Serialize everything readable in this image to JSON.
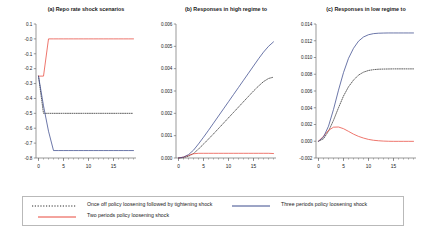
{
  "figure": {
    "panels": [
      {
        "id": "a",
        "title": "(a) Repo rate shock scenarios",
        "ylim": [
          -0.8,
          0.1
        ],
        "yticks": [
          "0.1",
          "-0.0",
          "-0.1",
          "-0.2",
          "-0.3",
          "-0.4",
          "-0.5",
          "-0.6",
          "-0.7",
          "-0.8"
        ],
        "ytickvals": [
          0.1,
          0.0,
          -0.1,
          -0.2,
          -0.3,
          -0.4,
          -0.5,
          -0.6,
          -0.7,
          -0.8
        ],
        "xlim": [
          -0.5,
          19.5
        ],
        "xticks": [
          "0",
          "5",
          "10",
          "15"
        ],
        "xtickvals": [
          0,
          5,
          10,
          15
        ]
      },
      {
        "id": "b",
        "title": "(b) Responses in high regime to",
        "ylim": [
          0.0,
          0.006
        ],
        "yticks": [
          "0.000",
          "0.001",
          "0.002",
          "0.003",
          "0.004",
          "0.005",
          "0.006"
        ],
        "ytickvals": [
          0.0,
          0.001,
          0.002,
          0.003,
          0.004,
          0.005,
          0.006
        ],
        "xlim": [
          -0.5,
          19.5
        ],
        "xticks": [
          "0",
          "5",
          "10",
          "15"
        ],
        "xtickvals": [
          0,
          5,
          10,
          15
        ]
      },
      {
        "id": "c",
        "title": "(c) Responses in low regime to",
        "ylim": [
          -0.002,
          0.014
        ],
        "yticks": [
          "-0.002",
          "0.000",
          "0.002",
          "0.004",
          "0.006",
          "0.008",
          "0.010",
          "0.012",
          "0.014"
        ],
        "ytickvals": [
          -0.002,
          0.0,
          0.002,
          0.004,
          0.006,
          0.008,
          0.01,
          0.012,
          0.014
        ],
        "xlim": [
          -0.5,
          19.5
        ],
        "xticks": [
          "0",
          "5",
          "10",
          "15"
        ],
        "xtickvals": [
          0,
          5,
          10,
          15
        ]
      }
    ],
    "legend": {
      "items": [
        {
          "label": "Once off policy loosening followed by tightening shock",
          "color": "#2a2a2a",
          "style": "dotted"
        },
        {
          "label": "Three periods policy loosening shock",
          "color": "#3b4a8c",
          "style": "solid"
        },
        {
          "label": "Two periods policy loosening shock",
          "color": "#e8483c",
          "style": "solid"
        }
      ]
    },
    "colors": {
      "once_off": "#2a2a2a",
      "three_periods": "#3b4a8c",
      "two_periods": "#e8483c",
      "axis": "#6e6e6e",
      "text": "#1a1a1a",
      "legend_border": "#b9b9b9"
    }
  },
  "chart_data": [
    {
      "type": "line",
      "panel": "a",
      "title": "(a) Repo rate shock scenarios",
      "xlabel": "",
      "ylabel": "",
      "xlim": [
        -0.5,
        19.5
      ],
      "ylim": [
        -0.8,
        0.1
      ],
      "grid": false,
      "legend_position": "bottom-shared",
      "x": [
        0,
        1,
        2,
        3,
        4,
        5,
        6,
        7,
        8,
        9,
        10,
        11,
        12,
        13,
        14,
        15,
        16,
        17,
        18,
        19
      ],
      "series": [
        {
          "name": "Once off policy loosening followed by tightening shock",
          "values": [
            -0.25,
            -0.5,
            -0.5,
            -0.5,
            -0.5,
            -0.5,
            -0.5,
            -0.5,
            -0.5,
            -0.5,
            -0.5,
            -0.5,
            -0.5,
            -0.5,
            -0.5,
            -0.5,
            -0.5,
            -0.5,
            -0.5,
            -0.5
          ],
          "color": "#2a2a2a",
          "style": "dotted"
        },
        {
          "name": "Two periods policy loosening shock",
          "values": [
            -0.25,
            -0.25,
            0.0,
            0.0,
            0.0,
            0.0,
            0.0,
            0.0,
            0.0,
            0.0,
            0.0,
            0.0,
            0.0,
            0.0,
            0.0,
            0.0,
            0.0,
            0.0,
            0.0,
            0.0
          ],
          "color": "#e8483c",
          "style": "solid"
        },
        {
          "name": "Three periods policy loosening shock",
          "values": [
            -0.25,
            -0.45,
            -0.62,
            -0.75,
            -0.75,
            -0.75,
            -0.75,
            -0.75,
            -0.75,
            -0.75,
            -0.75,
            -0.75,
            -0.75,
            -0.75,
            -0.75,
            -0.75,
            -0.75,
            -0.75,
            -0.75,
            -0.75
          ],
          "color": "#3b4a8c",
          "style": "solid"
        }
      ]
    },
    {
      "type": "line",
      "panel": "b",
      "title": "(b) Responses in high regime to",
      "xlabel": "",
      "ylabel": "",
      "xlim": [
        -0.5,
        19.5
      ],
      "ylim": [
        0.0,
        0.006
      ],
      "grid": false,
      "legend_position": "bottom-shared",
      "x": [
        0,
        1,
        2,
        3,
        4,
        5,
        6,
        7,
        8,
        9,
        10,
        11,
        12,
        13,
        14,
        15,
        16,
        17,
        18,
        19
      ],
      "series": [
        {
          "name": "Once off policy loosening followed by tightening shock",
          "values": [
            0.0,
            2e-05,
            8e-05,
            0.0002,
            0.0004,
            0.00062,
            0.00085,
            0.00108,
            0.00132,
            0.00156,
            0.0018,
            0.00204,
            0.00228,
            0.00252,
            0.00276,
            0.003,
            0.00322,
            0.00342,
            0.00356,
            0.00362
          ],
          "color": "#2a2a2a",
          "style": "dotted"
        },
        {
          "name": "Two periods policy loosening shock",
          "values": [
            0.0,
            4e-05,
            0.00012,
            0.00019,
            0.00021,
            0.00021,
            0.00021,
            0.00021,
            0.00021,
            0.00021,
            0.00021,
            0.00021,
            0.00021,
            0.00021,
            0.00021,
            0.00021,
            0.00021,
            0.00021,
            0.00021,
            0.0002
          ],
          "color": "#e8483c",
          "style": "solid"
        },
        {
          "name": "Three periods policy loosening shock",
          "values": [
            0.0,
            4e-05,
            0.00015,
            0.00035,
            0.00063,
            0.00093,
            0.00124,
            0.00156,
            0.00188,
            0.0022,
            0.00252,
            0.00284,
            0.00316,
            0.00348,
            0.0038,
            0.00412,
            0.00444,
            0.00474,
            0.005,
            0.0052
          ],
          "color": "#3b4a8c",
          "style": "solid"
        }
      ]
    },
    {
      "type": "line",
      "panel": "c",
      "title": "(c) Responses in low regime to",
      "xlabel": "",
      "ylabel": "",
      "xlim": [
        -0.5,
        19.5
      ],
      "ylim": [
        -0.002,
        0.014
      ],
      "grid": false,
      "legend_position": "bottom-shared",
      "x": [
        0,
        1,
        2,
        3,
        4,
        5,
        6,
        7,
        8,
        9,
        10,
        11,
        12,
        13,
        14,
        15,
        16,
        17,
        18,
        19
      ],
      "series": [
        {
          "name": "Once off policy loosening followed by tightening shock",
          "values": [
            0.0,
            0.0003,
            0.0012,
            0.0025,
            0.004,
            0.0054,
            0.0065,
            0.0073,
            0.0079,
            0.00825,
            0.00845,
            0.00855,
            0.0086,
            0.00862,
            0.00863,
            0.00864,
            0.00864,
            0.00864,
            0.00864,
            0.00864
          ],
          "color": "#2a2a2a",
          "style": "dotted"
        },
        {
          "name": "Two periods policy loosening shock",
          "values": [
            0.0,
            0.0006,
            0.0013,
            0.00168,
            0.0017,
            0.0015,
            0.00118,
            0.00085,
            0.00058,
            0.00038,
            0.00022,
            0.00012,
            6e-05,
            2e-05,
            0.0,
            -1e-05,
            -1e-05,
            -1e-05,
            -1e-05,
            -1e-05
          ],
          "color": "#e8483c",
          "style": "solid"
        },
        {
          "name": "Three periods policy loosening shock",
          "values": [
            0.0,
            0.0005,
            0.0018,
            0.0038,
            0.0061,
            0.0082,
            0.0099,
            0.0111,
            0.01195,
            0.01245,
            0.01272,
            0.01285,
            0.0129,
            0.01292,
            0.01293,
            0.01293,
            0.01293,
            0.01293,
            0.01293,
            0.01293
          ],
          "color": "#3b4a8c",
          "style": "solid"
        }
      ]
    }
  ]
}
